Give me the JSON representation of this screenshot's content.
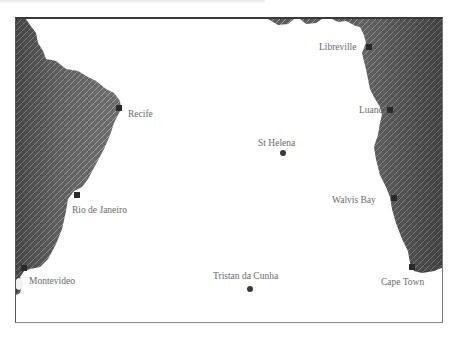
{
  "map": {
    "region": "South Atlantic Ocean",
    "colors": {
      "ocean": "#ffffff",
      "land_dark": "#4a4a4a",
      "land_light": "#9a9a9a",
      "frame": "#3a3a3a",
      "label": "#6a6a6a",
      "marker": "#2a2a2a"
    },
    "cities": [
      {
        "name": "Recife",
        "type": "port",
        "marker": "square"
      },
      {
        "name": "Rio de Janeiro",
        "type": "port",
        "marker": "square"
      },
      {
        "name": "Montevideo",
        "type": "port",
        "marker": "square"
      },
      {
        "name": "Libreville",
        "type": "port",
        "marker": "square"
      },
      {
        "name": "Luanda",
        "type": "port",
        "marker": "square"
      },
      {
        "name": "Walvis Bay",
        "type": "port",
        "marker": "square"
      },
      {
        "name": "Cape Town",
        "type": "port",
        "marker": "square"
      }
    ],
    "islands": [
      {
        "name": "St Helena",
        "marker": "circle"
      },
      {
        "name": "Tristan da Cunha",
        "marker": "circle"
      }
    ]
  }
}
